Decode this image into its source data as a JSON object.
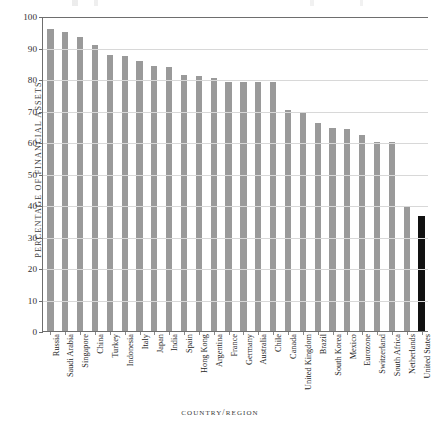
{
  "chart_data": {
    "type": "bar",
    "title": "",
    "xlabel": "COUNTRY/REGION",
    "ylabel": "PERCENTAGE OF FINANCIAL ASSETS",
    "ylim": [
      0,
      100
    ],
    "yticks": [
      0,
      10,
      20,
      30,
      40,
      50,
      60,
      70,
      80,
      90,
      100
    ],
    "ytick_labels": [
      "0",
      "10",
      "20",
      "30",
      "40",
      "50",
      "60",
      "70",
      "80",
      "90",
      "100"
    ],
    "grid": true,
    "legend": "none",
    "bar_color": "#9a9a9a",
    "highlight_color": "#111111",
    "highlight_category": "United States",
    "categories": [
      "Russia",
      "Saudi Arabia",
      "Singapore",
      "China",
      "Turkey",
      "Indonesia",
      "Italy",
      "Japan",
      "India",
      "Spain",
      "Hong Kong",
      "Argentina",
      "France",
      "Germany",
      "Australia",
      "Chile",
      "Canada",
      "United Kingdom",
      "Brazil",
      "South Korea",
      "Mexico",
      "Eurozone",
      "Switzerland",
      "South Africa",
      "Netherlands",
      "United States"
    ],
    "values": [
      95.8,
      95.0,
      93.3,
      90.7,
      87.5,
      87.2,
      85.6,
      84.1,
      83.9,
      81.2,
      81.0,
      80.4,
      79.1,
      79.1,
      79.0,
      79.0,
      70.2,
      69.3,
      66.1,
      64.3,
      64.0,
      62.1,
      60.1,
      60.0,
      39.6,
      36.6
    ]
  },
  "axes": {
    "y_title": "PERCENTAGE OF FINANCIAL ASSETS",
    "x_title_part1": "COUNTRY",
    "x_title_sep": "/",
    "x_title_part2": "REGION"
  }
}
